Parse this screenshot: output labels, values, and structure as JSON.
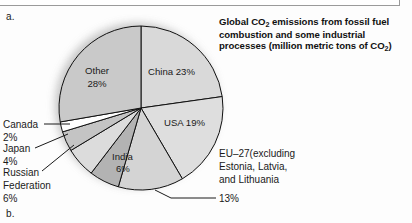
{
  "figure": {
    "letter_top": "a.",
    "letter_bottom": "b.",
    "title_line1_pre": "Global CO",
    "title_sub1": "2",
    "title_line1_post": " emissions from fossil fuel",
    "title_line2": "combustion and some industrial",
    "title_line3_pre": "processes (million metric tons of CO",
    "title_sub2": "2",
    "title_line3_post": ")"
  },
  "chart_data": {
    "type": "pie",
    "title": "Global CO2 emissions from fossil fuel combustion and some industrial processes (million metric tons of CO2)",
    "units": "percent of global total",
    "start_angle_deg": 0,
    "direction": "clockwise",
    "legend": "none (direct labels and callouts)",
    "categories": [
      "China",
      "USA",
      "EU–27 (excluding Estonia, Latvia, and Lithuania)",
      "India",
      "Russian Federation",
      "Japan",
      "Canada",
      "Other"
    ],
    "values": [
      23,
      19,
      13,
      6,
      6,
      4,
      2,
      28
    ],
    "slices": [
      {
        "name": "China",
        "value": 23,
        "label": "China 23%",
        "label_kind": "inside",
        "color": "#d9d9d9"
      },
      {
        "name": "USA",
        "value": 19,
        "label": "USA 19%",
        "label_kind": "inside",
        "color": "#dedede"
      },
      {
        "name": "EU-27",
        "value": 13,
        "label": "13%",
        "label_kind": "callout",
        "color": "#d4d4d4"
      },
      {
        "name": "India",
        "value": 6,
        "label": "India\n6%",
        "label_kind": "inside",
        "color": "#b3b3b3"
      },
      {
        "name": "Russian Federation",
        "value": 6,
        "label": "Russian Federation 6%",
        "label_kind": "callout",
        "color": "#dcdcdc"
      },
      {
        "name": "Japan",
        "value": 4,
        "label": "Japan 4%",
        "label_kind": "callout",
        "color": "#c4c4c4"
      },
      {
        "name": "Canada",
        "value": 2,
        "label": "Canada 2%",
        "label_kind": "callout",
        "color": "#fefefe"
      },
      {
        "name": "Other",
        "value": 28,
        "label": "Other 28%",
        "label_kind": "inside",
        "color": "#c9c9c9"
      }
    ],
    "inside_labels": {
      "china": "China 23%",
      "usa": "USA 19%",
      "other_l1": "Other",
      "other_l2": "28%",
      "india_l1": "India",
      "india_l2": "6%"
    },
    "callouts": {
      "canada_l1": "Canada",
      "canada_l2": "2%",
      "japan_l1": "Japan",
      "japan_l2": "4%",
      "russia_l1": "Russian",
      "russia_l2": "Federation",
      "russia_l3": "6%",
      "eu_l1": "EU–27(excluding",
      "eu_l2": "Estonia, Latvia,",
      "eu_l3": "and Lithuania",
      "eu_l4": "13%"
    },
    "colors": {
      "stroke": "#111111",
      "background": "#fdfdfd",
      "shadow": "#b8b8b8"
    }
  }
}
